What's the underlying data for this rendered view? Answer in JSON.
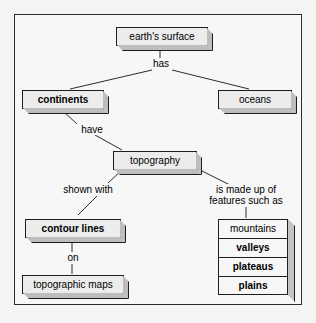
{
  "diagram": {
    "frame": {
      "border_color": "#2b2b2b",
      "background": "#f7f7f7"
    },
    "nodes": {
      "earths_surface": {
        "label": "earth's surface",
        "bold": false
      },
      "continents": {
        "label": "continents",
        "bold": true
      },
      "oceans": {
        "label": "oceans",
        "bold": false
      },
      "topography": {
        "label": "topography",
        "bold": false
      },
      "contour_lines": {
        "label": "contour lines",
        "bold": true
      },
      "topographic_maps": {
        "label": "topographic maps",
        "bold": false
      }
    },
    "feature_stack": [
      {
        "label": "mountains",
        "bold": false
      },
      {
        "label": "valleys",
        "bold": true
      },
      {
        "label": "plateaus",
        "bold": true
      },
      {
        "label": "plains",
        "bold": true
      }
    ],
    "link_labels": {
      "has": "has",
      "have": "have",
      "shown_with": "shown with",
      "on": "on",
      "made_up_of_line1": "is made up of",
      "made_up_of_line2": "features such as"
    }
  }
}
